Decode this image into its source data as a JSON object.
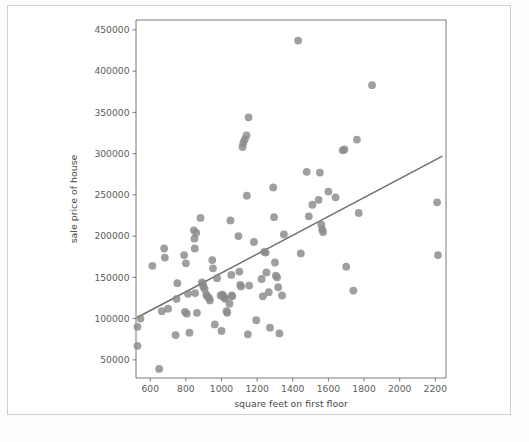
{
  "chart_data": {
    "type": "scatter",
    "title": "",
    "xlabel": "square feet on first floor",
    "ylabel": "sale price of house",
    "xlim": [
      520,
      2260
    ],
    "ylim": [
      28000,
      462000
    ],
    "xticks": [
      600,
      800,
      1000,
      1200,
      1400,
      1600,
      1800,
      2000,
      2200
    ],
    "xticklabels": [
      "600",
      "800",
      "1000",
      "1200",
      "1400",
      "1600",
      "1800",
      "2000",
      "2200"
    ],
    "yticks": [
      50000,
      100000,
      150000,
      200000,
      250000,
      300000,
      350000,
      400000,
      450000
    ],
    "yticklabels": [
      "50000",
      "100000",
      "150000",
      "200000",
      "250000",
      "300000",
      "350000",
      "400000",
      "450000"
    ],
    "grid": false,
    "legend": null,
    "marker_color": "#8a8a8a",
    "marker_size": 5.2,
    "trendline": {
      "type": "linear-fit",
      "color": "#6e6e6e",
      "x_start": 524,
      "y_start": 101000,
      "x_end": 2240,
      "y_end": 297000
    },
    "points": [
      [
        528,
        90000
      ],
      [
        528,
        67000
      ],
      [
        545,
        100000
      ],
      [
        612,
        164000
      ],
      [
        650,
        39000
      ],
      [
        665,
        109000
      ],
      [
        678,
        185000
      ],
      [
        682,
        174000
      ],
      [
        700,
        112000
      ],
      [
        742,
        80000
      ],
      [
        748,
        124000
      ],
      [
        752,
        143000
      ],
      [
        790,
        177000
      ],
      [
        795,
        108000
      ],
      [
        800,
        167000
      ],
      [
        805,
        106000
      ],
      [
        812,
        130000
      ],
      [
        820,
        83000
      ],
      [
        845,
        207000
      ],
      [
        848,
        197000
      ],
      [
        850,
        185000
      ],
      [
        852,
        131000
      ],
      [
        858,
        204000
      ],
      [
        862,
        107000
      ],
      [
        882,
        222000
      ],
      [
        890,
        144000
      ],
      [
        895,
        142000
      ],
      [
        898,
        139000
      ],
      [
        905,
        136000
      ],
      [
        915,
        129000
      ],
      [
        920,
        127000
      ],
      [
        930,
        125000
      ],
      [
        935,
        122000
      ],
      [
        948,
        171000
      ],
      [
        952,
        161000
      ],
      [
        962,
        93000
      ],
      [
        975,
        149000
      ],
      [
        995,
        128000
      ],
      [
        1000,
        85000
      ],
      [
        1005,
        129000
      ],
      [
        1010,
        127000
      ],
      [
        1015,
        126000
      ],
      [
        1020,
        124000
      ],
      [
        1028,
        109000
      ],
      [
        1032,
        107000
      ],
      [
        1045,
        118000
      ],
      [
        1050,
        219000
      ],
      [
        1055,
        153000
      ],
      [
        1058,
        128000
      ],
      [
        1060,
        127000
      ],
      [
        1095,
        200000
      ],
      [
        1100,
        157000
      ],
      [
        1105,
        141000
      ],
      [
        1110,
        139000
      ],
      [
        1118,
        308000
      ],
      [
        1122,
        313000
      ],
      [
        1130,
        317000
      ],
      [
        1140,
        322000
      ],
      [
        1142,
        249000
      ],
      [
        1148,
        81000
      ],
      [
        1152,
        344000
      ],
      [
        1155,
        140000
      ],
      [
        1182,
        193000
      ],
      [
        1195,
        98000
      ],
      [
        1225,
        148000
      ],
      [
        1232,
        127000
      ],
      [
        1240,
        181000
      ],
      [
        1248,
        180000
      ],
      [
        1252,
        156000
      ],
      [
        1265,
        132000
      ],
      [
        1272,
        89000
      ],
      [
        1290,
        259000
      ],
      [
        1295,
        223000
      ],
      [
        1300,
        168000
      ],
      [
        1305,
        152000
      ],
      [
        1312,
        150000
      ],
      [
        1318,
        138000
      ],
      [
        1325,
        82000
      ],
      [
        1340,
        128000
      ],
      [
        1350,
        202000
      ],
      [
        1430,
        437000
      ],
      [
        1445,
        179000
      ],
      [
        1478,
        278000
      ],
      [
        1490,
        224000
      ],
      [
        1510,
        238000
      ],
      [
        1545,
        244000
      ],
      [
        1552,
        277000
      ],
      [
        1560,
        214000
      ],
      [
        1565,
        208000
      ],
      [
        1570,
        205000
      ],
      [
        1600,
        254000
      ],
      [
        1640,
        247000
      ],
      [
        1680,
        304000
      ],
      [
        1690,
        305000
      ],
      [
        1700,
        163000
      ],
      [
        1740,
        134000
      ],
      [
        1760,
        317000
      ],
      [
        1770,
        228000
      ],
      [
        1845,
        383000
      ],
      [
        2210,
        241000
      ],
      [
        2215,
        177000
      ]
    ]
  },
  "caption": {
    "text": ""
  }
}
